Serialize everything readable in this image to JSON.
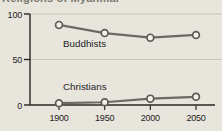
{
  "figure": {
    "cropped_title_fragment": "Religions of Myanmar",
    "background_color": "#e8e5dc"
  },
  "chart_data": {
    "type": "line",
    "title": "",
    "xlabel": "",
    "ylabel": "",
    "x": [
      1900,
      1950,
      2000,
      2050
    ],
    "x_tick_labels": [
      "1900",
      "1950",
      "2000",
      "2050"
    ],
    "ylim": [
      0,
      100
    ],
    "yticks": [
      0,
      50,
      100
    ],
    "grid": true,
    "legend": "inline-labels-on-chart",
    "series": [
      {
        "name": "Buddhists",
        "values": [
          88,
          79,
          74,
          77
        ],
        "label_position": "below-line"
      },
      {
        "name": "Christians",
        "values": [
          2,
          3,
          7,
          9
        ],
        "label_position": "above-line"
      }
    ],
    "colors": {
      "line": "#6c6a66",
      "marker_fill": "#f3f1e8",
      "marker_stroke": "#5c5a56",
      "axis": "#2a2824",
      "gridline": "#c7c4b8",
      "text": "#24231f"
    }
  }
}
